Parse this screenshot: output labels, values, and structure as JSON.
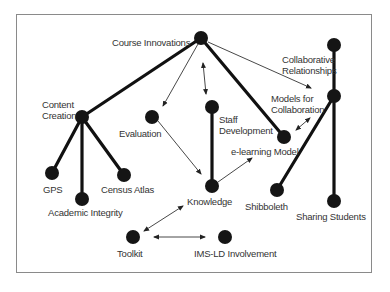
{
  "diagram": {
    "frame_color": "#8a8a8a",
    "node_color": "#1a1a1a",
    "nodes": [
      {
        "id": "course_innovations",
        "label": "Course Innovations"
      },
      {
        "id": "content_creation",
        "label_line1": "Content",
        "label_line2": "Creation"
      },
      {
        "id": "evaluation",
        "label": "Evaluation"
      },
      {
        "id": "staff_development",
        "label_line1": "Staff",
        "label_line2": "Development"
      },
      {
        "id": "elearning_model",
        "label": "e-learning Model"
      },
      {
        "id": "collaborative_relationships",
        "label_line1": "Collaborative",
        "label_line2": "Relationships"
      },
      {
        "id": "models_for_collaboration",
        "label_line1": "Models for",
        "label_line2": "Collaboration"
      },
      {
        "id": "gps",
        "label": "GPS"
      },
      {
        "id": "academic_integrity",
        "label": "Academic Integrity"
      },
      {
        "id": "census_atlas",
        "label": "Census Atlas"
      },
      {
        "id": "knowledge",
        "label": "Knowledge"
      },
      {
        "id": "shibboleth",
        "label": "Shibboleth"
      },
      {
        "id": "sharing_students",
        "label": "Sharing Students"
      },
      {
        "id": "toolkit",
        "label": "Toolkit"
      },
      {
        "id": "ims_ld",
        "label": "IMS-LD Involvement"
      }
    ],
    "edges": [
      {
        "from": "course_innovations",
        "to": "content_creation",
        "style": "thick"
      },
      {
        "from": "course_innovations",
        "to": "elearning_model",
        "style": "thick"
      },
      {
        "from": "content_creation",
        "to": "gps",
        "style": "thick"
      },
      {
        "from": "content_creation",
        "to": "academic_integrity",
        "style": "thick"
      },
      {
        "from": "content_creation",
        "to": "census_atlas",
        "style": "thick"
      },
      {
        "from": "staff_development",
        "to": "knowledge",
        "style": "thick"
      },
      {
        "from": "collaborative_relationships",
        "to": "sharing_students",
        "style": "thick"
      },
      {
        "from": "models_for_collaboration",
        "to": "shibboleth",
        "style": "thick"
      },
      {
        "from": "course_innovations",
        "to": "evaluation",
        "style": "arrow"
      },
      {
        "from": "course_innovations",
        "to": "staff_development",
        "style": "double-arrow"
      },
      {
        "from": "course_innovations",
        "to": "models_for_collaboration",
        "style": "arrow"
      },
      {
        "from": "evaluation",
        "to": "knowledge",
        "style": "arrow"
      },
      {
        "from": "knowledge",
        "to": "elearning_model",
        "style": "arrow"
      },
      {
        "from": "elearning_model",
        "to": "models_for_collaboration",
        "style": "double-arrow"
      },
      {
        "from": "knowledge",
        "to": "toolkit",
        "style": "double-arrow"
      },
      {
        "from": "toolkit",
        "to": "ims_ld",
        "style": "double-arrow"
      }
    ]
  }
}
